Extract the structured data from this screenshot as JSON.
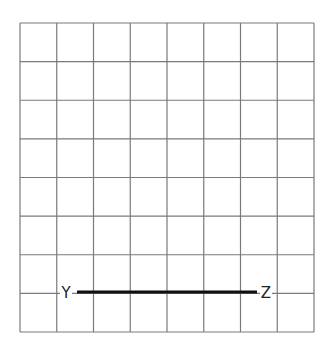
{
  "grid": {
    "columns": 8,
    "rows": 8,
    "left": 20,
    "top": 23,
    "right": 314,
    "bottom": 332,
    "line_color": "#7a7a7a",
    "line_width": 1.2
  },
  "segment": {
    "name": "YZ",
    "y": 292,
    "x1": 77,
    "x2": 257,
    "color": "#111111",
    "width": 3
  },
  "labels": [
    {
      "id": "Y",
      "text": "Y",
      "x": 66,
      "y": 298
    },
    {
      "id": "Z",
      "text": "Z",
      "x": 266,
      "y": 298
    }
  ]
}
